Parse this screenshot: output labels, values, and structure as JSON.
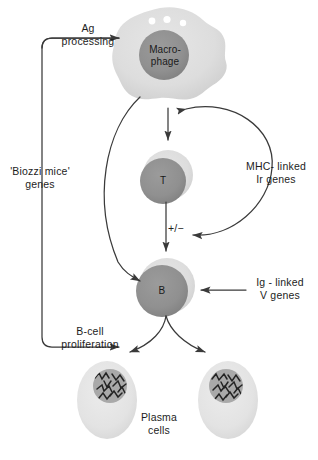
{
  "figure": {
    "title": "Genetic control of the antibody response",
    "background_color": "#ffffff",
    "line_color": "#3a3a3a",
    "text_color": "#1d1d1d"
  },
  "cells": {
    "macrophage": {
      "label": "Macro-\nphage",
      "cytoplasm_color": "#dcdcdc",
      "nucleus_color": "#8c8c8c",
      "vacuoles": 3
    },
    "t_cell": {
      "label": "T",
      "cytoplasm_color": "#dcdcdc",
      "nucleus_color": "#8f8f8f"
    },
    "b_cell": {
      "label": "B",
      "cytoplasm_color": "#dcdcdc",
      "nucleus_color": "#8f8f8f"
    },
    "plasma_cells": {
      "label": "Plasma\ncells",
      "cytoplasm_color": "#e4e4e4",
      "nucleus_color": "#a8a8a8",
      "count": 2
    }
  },
  "labels": {
    "ag_processing": "Ag\nprocessing",
    "biozzi_genes": "'Biozzi mice'\ngenes",
    "mhc_linked_line1": "MHC- linked",
    "mhc_linked_line2": "Ir genes",
    "mhc_linked_italic": "Ir",
    "plus_minus": "+/−",
    "ig_linked_line1": "Ig - linked",
    "ig_linked_line2": "V genes",
    "ig_linked_italic": "V",
    "b_cell_proliferation": "B-cell\nproliferation",
    "plasma_cells": "Plasma\ncells"
  },
  "caption": {
    "text": "4.5  Genetic control of the antibody response"
  }
}
